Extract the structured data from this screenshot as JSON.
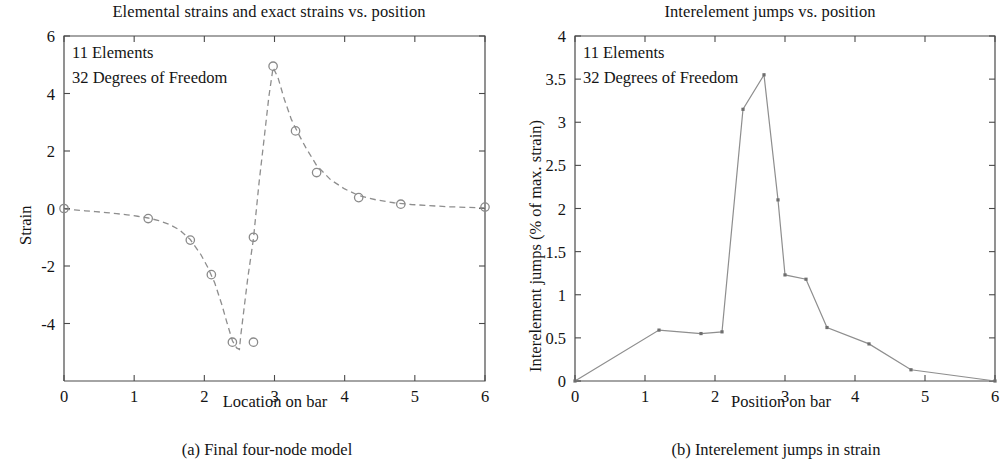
{
  "figure": {
    "panels": [
      {
        "key": "a",
        "title": "Elemental strains and exact strains vs. position",
        "xlabel": "Location on bar",
        "ylabel": "Strain",
        "subcaption": "(a) Final four-node model",
        "annotations": [
          "11 Elements",
          "32 Degrees of Freedom"
        ]
      },
      {
        "key": "b",
        "title": "Interelement jumps vs. position",
        "xlabel": "Position on bar",
        "ylabel": "Interelement jumps (% of max. strain)",
        "subcaption": "(b) Interelement jumps in strain",
        "annotations": [
          "11 Elements",
          "32 Degrees of Freedom"
        ]
      }
    ]
  },
  "chart_data": [
    {
      "type": "line",
      "panel": "a",
      "title": "Elemental strains and exact strains vs. position",
      "xlabel": "Location on bar",
      "ylabel": "Strain",
      "xlim": [
        0,
        6
      ],
      "ylim": [
        -6,
        6
      ],
      "xticks": [
        0,
        1,
        2,
        3,
        4,
        5,
        6
      ],
      "xticklabels": [
        "0",
        "1",
        "2",
        "3",
        "4",
        "5",
        "6"
      ],
      "yticks": [
        -4,
        -2,
        0,
        2,
        4,
        6
      ],
      "yticklabels": [
        "-4",
        "-2",
        "0",
        "2",
        "4",
        "6"
      ],
      "grid": false,
      "legend": null,
      "annotations": [
        "11 Elements",
        "32 Degrees of Freedom"
      ],
      "series": [
        {
          "name": "Exact strain",
          "style": "dashed",
          "marker": "none",
          "x": [
            0.0,
            0.15,
            0.3,
            0.45,
            0.6,
            0.75,
            0.9,
            1.05,
            1.2,
            1.35,
            1.5,
            1.65,
            1.8,
            1.95,
            2.05,
            2.15,
            2.25,
            2.32,
            2.4,
            2.46,
            2.5,
            2.52,
            2.56,
            2.62,
            2.7,
            2.78,
            2.86,
            2.92,
            2.98,
            3.05,
            3.14,
            3.24,
            3.34,
            3.45,
            3.6,
            3.8,
            4.0,
            4.2,
            4.45,
            4.7,
            4.95,
            5.2,
            5.5,
            5.75,
            6.0
          ],
          "y": [
            -0.02,
            -0.05,
            -0.08,
            -0.11,
            -0.14,
            -0.18,
            -0.22,
            -0.27,
            -0.33,
            -0.42,
            -0.55,
            -0.75,
            -1.08,
            -1.6,
            -2.05,
            -2.6,
            -3.35,
            -3.95,
            -4.6,
            -4.85,
            -4.9,
            -4.4,
            -3.6,
            -2.4,
            -1.05,
            0.9,
            2.6,
            3.9,
            4.9,
            4.55,
            3.8,
            3.1,
            2.6,
            2.1,
            1.5,
            1.0,
            0.68,
            0.45,
            0.3,
            0.2,
            0.14,
            0.1,
            0.06,
            0.04,
            0.02
          ]
        },
        {
          "name": "Elemental strain nodes",
          "style": "markers",
          "marker": "circle",
          "x": [
            0.0,
            1.2,
            1.8,
            2.1,
            2.4,
            2.7,
            2.7,
            2.98,
            3.3,
            3.6,
            4.2,
            4.8,
            6.0
          ],
          "y": [
            0.0,
            -0.35,
            -1.1,
            -2.3,
            -4.65,
            -4.65,
            -1.0,
            4.95,
            2.7,
            1.25,
            0.38,
            0.15,
            0.05
          ]
        }
      ]
    },
    {
      "type": "line",
      "panel": "b",
      "title": "Interelement jumps vs. position",
      "xlabel": "Position on bar",
      "ylabel": "Interelement jumps (% of max. strain)",
      "xlim": [
        0,
        6
      ],
      "ylim": [
        0,
        4
      ],
      "xticks": [
        0,
        1,
        2,
        3,
        4,
        5,
        6
      ],
      "xticklabels": [
        "0",
        "1",
        "2",
        "3",
        "4",
        "5",
        "6"
      ],
      "yticks": [
        0,
        0.5,
        1,
        1.5,
        2,
        2.5,
        3,
        3.5,
        4
      ],
      "yticklabels": [
        "0",
        "0.5",
        "1",
        "1.5",
        "2",
        "2.5",
        "3",
        "3.5",
        "4"
      ],
      "grid": false,
      "legend": null,
      "annotations": [
        "11 Elements",
        "32 Degrees of Freedom"
      ],
      "series": [
        {
          "name": "Interelement jump",
          "style": "solid",
          "marker": "dot",
          "x": [
            0.0,
            1.2,
            1.8,
            2.1,
            2.4,
            2.7,
            2.9,
            3.0,
            3.3,
            3.6,
            4.2,
            4.8,
            6.0
          ],
          "y": [
            0.0,
            0.59,
            0.55,
            0.57,
            3.15,
            3.55,
            2.1,
            1.23,
            1.18,
            0.62,
            0.43,
            0.13,
            0.0
          ]
        }
      ]
    }
  ]
}
